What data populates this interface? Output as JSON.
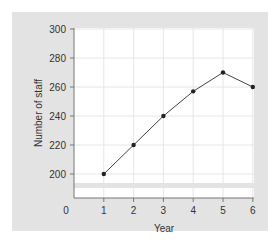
{
  "chart_data": {
    "type": "line",
    "title": "",
    "xlabel": "Year",
    "ylabel": "Number of staff",
    "x": [
      1,
      2,
      3,
      4,
      5,
      6
    ],
    "values": [
      200,
      220,
      240,
      257,
      270,
      260
    ],
    "x_ticks": [
      "0",
      "1",
      "2",
      "3",
      "4",
      "5",
      "6"
    ],
    "y_ticks": [
      "200",
      "220",
      "240",
      "260",
      "280",
      "300"
    ],
    "ylim": [
      200,
      300
    ],
    "xlim": [
      0,
      6
    ],
    "y_axis_break": true,
    "grid": true,
    "legend": null
  },
  "colors": {
    "panel_bg": "#e3e3e3",
    "plot_bg": "#ffffff",
    "grid": "#e6e6e6",
    "line": "#444444",
    "marker": "#222222",
    "axis": "#777777",
    "text": "#333333"
  }
}
